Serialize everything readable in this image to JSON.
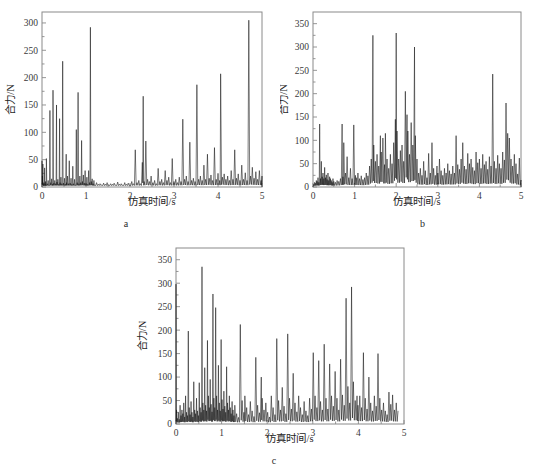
{
  "figure": {
    "panels": [
      {
        "id": "a",
        "sublabel": "a",
        "xlabel": "仿真时间/s",
        "ylabel": "合力/N"
      },
      {
        "id": "b",
        "sublabel": "b",
        "xlabel": "仿真时间/s",
        "ylabel": "合力/N"
      },
      {
        "id": "c",
        "sublabel": "c",
        "xlabel": "仿真时间/s",
        "ylabel": "合力/N"
      }
    ]
  },
  "chart_data": [
    {
      "type": "line",
      "panel": "a",
      "title": "",
      "subtitle": "a",
      "xlabel": "仿真时间/s",
      "ylabel": "合力/N",
      "xlim": [
        0,
        5
      ],
      "ylim": [
        0,
        320
      ],
      "xticks": [
        0,
        1,
        2,
        3,
        4,
        5
      ],
      "xticklabels": [
        "0",
        "1",
        "2",
        "3",
        "4",
        "5"
      ],
      "yticks": [
        0,
        50,
        100,
        150,
        200,
        250,
        300
      ],
      "yticklabels": [
        "0",
        "50",
        "100",
        "150",
        "200",
        "250",
        "300"
      ],
      "grid": false,
      "legend": null,
      "series": [
        {
          "name": "合力",
          "color": "#111111",
          "x": [
            0.0,
            0.01,
            0.02,
            0.03,
            0.04,
            0.05,
            0.06,
            0.07,
            0.08,
            0.09,
            0.1,
            0.12,
            0.14,
            0.16,
            0.18,
            0.2,
            0.22,
            0.24,
            0.25,
            0.27,
            0.29,
            0.31,
            0.33,
            0.34,
            0.36,
            0.38,
            0.4,
            0.41,
            0.43,
            0.45,
            0.47,
            0.49,
            0.51,
            0.53,
            0.55,
            0.56,
            0.58,
            0.6,
            0.62,
            0.64,
            0.66,
            0.68,
            0.7,
            0.72,
            0.74,
            0.76,
            0.78,
            0.8,
            0.82,
            0.84,
            0.86,
            0.88,
            0.9,
            0.92,
            0.94,
            0.96,
            0.98,
            1.0,
            1.02,
            1.04,
            1.06,
            1.08,
            1.1,
            1.12,
            1.14,
            1.16,
            1.18,
            1.2,
            1.24,
            1.28,
            1.32,
            1.36,
            1.4,
            1.44,
            1.48,
            1.52,
            1.56,
            1.6,
            1.64,
            1.68,
            1.72,
            1.76,
            1.8,
            1.84,
            1.88,
            1.92,
            1.96,
            2.0,
            2.04,
            2.08,
            2.12,
            2.16,
            2.2,
            2.24,
            2.28,
            2.3,
            2.32,
            2.36,
            2.4,
            2.44,
            2.48,
            2.52,
            2.56,
            2.6,
            2.64,
            2.68,
            2.72,
            2.76,
            2.8,
            2.84,
            2.88,
            2.92,
            2.96,
            3.0,
            3.04,
            3.08,
            3.12,
            3.16,
            3.2,
            3.24,
            3.28,
            3.32,
            3.36,
            3.4,
            3.44,
            3.48,
            3.52,
            3.56,
            3.6,
            3.64,
            3.68,
            3.72,
            3.76,
            3.8,
            3.84,
            3.88,
            3.92,
            3.96,
            4.0,
            4.04,
            4.06,
            4.1,
            4.14,
            4.18,
            4.22,
            4.26,
            4.3,
            4.34,
            4.38,
            4.42,
            4.46,
            4.5,
            4.54,
            4.58,
            4.62,
            4.66,
            4.7,
            4.74,
            4.78,
            4.82,
            4.86,
            4.9,
            4.94,
            4.98,
            5.0
          ],
          "y": [
            48,
            20,
            42,
            5,
            8,
            3,
            35,
            6,
            10,
            4,
            52,
            6,
            12,
            4,
            140,
            8,
            15,
            5,
            177,
            7,
            12,
            6,
            150,
            9,
            14,
            5,
            125,
            8,
            18,
            6,
            230,
            7,
            16,
            5,
            60,
            8,
            20,
            6,
            48,
            7,
            16,
            5,
            38,
            6,
            14,
            4,
            105,
            8,
            173,
            6,
            20,
            8,
            85,
            10,
            22,
            7,
            30,
            6,
            18,
            5,
            30,
            8,
            292,
            10,
            15,
            6,
            12,
            4,
            8,
            5,
            6,
            4,
            7,
            5,
            8,
            4,
            6,
            5,
            7,
            4,
            9,
            5,
            6,
            4,
            8,
            5,
            7,
            4,
            10,
            6,
            68,
            8,
            12,
            6,
            45,
            166,
            10,
            84,
            14,
            10,
            20,
            8,
            12,
            6,
            34,
            10,
            14,
            8,
            30,
            12,
            18,
            8,
            52,
            10,
            14,
            8,
            18,
            10,
            124,
            14,
            20,
            10,
            82,
            12,
            16,
            10,
            187,
            14,
            20,
            12,
            40,
            14,
            60,
            16,
            22,
            12,
            72,
            14,
            25,
            12,
            207,
            18,
            24,
            14,
            20,
            12,
            30,
            14,
            68,
            16,
            24,
            12,
            40,
            14,
            26,
            12,
            305,
            20,
            36,
            16,
            28,
            14,
            30,
            12,
            20,
            8
          ]
        }
      ]
    },
    {
      "type": "line",
      "panel": "b",
      "title": "",
      "subtitle": "b",
      "xlabel": "仿真时间/s",
      "ylabel": "合力/N",
      "xlim": [
        0,
        5
      ],
      "ylim": [
        0,
        375
      ],
      "xticks": [
        0,
        1,
        2,
        3,
        4,
        5
      ],
      "xticklabels": [
        "0",
        "1",
        "2",
        "3",
        "4",
        "5"
      ],
      "yticks": [
        0,
        50,
        100,
        150,
        200,
        250,
        300,
        350
      ],
      "yticklabels": [
        "0",
        "50",
        "100",
        "150",
        "200",
        "250",
        "300",
        "350"
      ],
      "grid": false,
      "legend": null,
      "series": [
        {
          "name": "合力",
          "color": "#111111",
          "x": [
            0.0,
            0.02,
            0.04,
            0.06,
            0.08,
            0.1,
            0.12,
            0.14,
            0.16,
            0.18,
            0.2,
            0.22,
            0.24,
            0.26,
            0.28,
            0.3,
            0.32,
            0.34,
            0.36,
            0.38,
            0.4,
            0.42,
            0.44,
            0.46,
            0.48,
            0.5,
            0.54,
            0.58,
            0.62,
            0.66,
            0.7,
            0.72,
            0.74,
            0.78,
            0.82,
            0.86,
            0.9,
            0.94,
            0.98,
            1.02,
            1.04,
            1.08,
            1.12,
            1.16,
            1.2,
            1.24,
            1.28,
            1.32,
            1.36,
            1.4,
            1.44,
            1.46,
            1.5,
            1.54,
            1.58,
            1.62,
            1.64,
            1.68,
            1.72,
            1.74,
            1.78,
            1.82,
            1.86,
            1.9,
            1.94,
            1.98,
            2.0,
            2.02,
            2.06,
            2.1,
            2.14,
            2.18,
            2.22,
            2.26,
            2.28,
            2.32,
            2.36,
            2.4,
            2.44,
            2.46,
            2.5,
            2.54,
            2.58,
            2.62,
            2.66,
            2.7,
            2.74,
            2.78,
            2.82,
            2.86,
            2.9,
            2.94,
            2.98,
            3.0,
            3.04,
            3.08,
            3.12,
            3.16,
            3.2,
            3.24,
            3.28,
            3.32,
            3.36,
            3.4,
            3.44,
            3.48,
            3.52,
            3.56,
            3.6,
            3.64,
            3.68,
            3.72,
            3.76,
            3.8,
            3.84,
            3.88,
            3.92,
            3.96,
            4.0,
            4.04,
            4.08,
            4.12,
            4.16,
            4.2,
            4.24,
            4.28,
            4.32,
            4.36,
            4.4,
            4.44,
            4.48,
            4.52,
            4.56,
            4.6,
            4.64,
            4.68,
            4.72,
            4.76,
            4.8,
            4.84,
            4.88,
            4.92,
            4.96,
            5.0
          ],
          "y": [
            2,
            6,
            10,
            8,
            14,
            12,
            20,
            10,
            135,
            18,
            55,
            22,
            30,
            18,
            42,
            20,
            26,
            16,
            30,
            14,
            22,
            18,
            14,
            10,
            18,
            12,
            10,
            14,
            12,
            18,
            135,
            22,
            95,
            30,
            65,
            20,
            40,
            18,
            133,
            25,
            20,
            30,
            18,
            24,
            16,
            20,
            30,
            24,
            45,
            60,
            325,
            90,
            55,
            70,
            45,
            110,
            75,
            105,
            48,
            115,
            60,
            40,
            70,
            50,
            95,
            145,
            330,
            120,
            60,
            78,
            90,
            55,
            205,
            155,
            120,
            70,
            138,
            90,
            300,
            110,
            60,
            30,
            40,
            25,
            55,
            35,
            20,
            72,
            30,
            95,
            40,
            25,
            45,
            30,
            60,
            35,
            25,
            40,
            30,
            50,
            35,
            28,
            45,
            30,
            110,
            48,
            38,
            60,
            95,
            45,
            38,
            72,
            50,
            60,
            42,
            35,
            75,
            52,
            60,
            40,
            70,
            48,
            55,
            38,
            65,
            45,
            242,
            55,
            40,
            68,
            50,
            40,
            75,
            58,
            180,
            115,
            105,
            60,
            45,
            70,
            50,
            28,
            62,
            15
          ]
        }
      ]
    },
    {
      "type": "line",
      "panel": "c",
      "title": "",
      "subtitle": "c",
      "xlabel": "仿真时间/s",
      "ylabel": "合力/N",
      "xlim": [
        0,
        5
      ],
      "ylim": [
        0,
        375
      ],
      "xticks": [
        0,
        1,
        2,
        3,
        4,
        5
      ],
      "xticklabels": [
        "0",
        "1",
        "2",
        "3",
        "4",
        "5"
      ],
      "yticks": [
        0,
        50,
        100,
        150,
        200,
        250,
        300,
        350
      ],
      "yticklabels": [
        "0",
        "50",
        "100",
        "150",
        "200",
        "250",
        "300",
        "350"
      ],
      "grid": false,
      "legend": null,
      "series": [
        {
          "name": "合力",
          "color": "#111111",
          "x": [
            0.0,
            0.01,
            0.03,
            0.05,
            0.07,
            0.09,
            0.11,
            0.13,
            0.15,
            0.17,
            0.19,
            0.21,
            0.23,
            0.25,
            0.27,
            0.29,
            0.31,
            0.33,
            0.35,
            0.37,
            0.39,
            0.41,
            0.43,
            0.45,
            0.47,
            0.49,
            0.51,
            0.53,
            0.55,
            0.57,
            0.59,
            0.61,
            0.63,
            0.65,
            0.67,
            0.69,
            0.71,
            0.73,
            0.75,
            0.77,
            0.79,
            0.81,
            0.83,
            0.85,
            0.87,
            0.89,
            0.91,
            0.93,
            0.95,
            0.97,
            0.99,
            1.01,
            1.03,
            1.05,
            1.07,
            1.09,
            1.11,
            1.13,
            1.15,
            1.17,
            1.19,
            1.21,
            1.23,
            1.25,
            1.27,
            1.29,
            1.33,
            1.37,
            1.41,
            1.45,
            1.49,
            1.51,
            1.55,
            1.59,
            1.63,
            1.67,
            1.71,
            1.75,
            1.79,
            1.83,
            1.87,
            1.89,
            1.93,
            1.97,
            2.01,
            2.05,
            2.09,
            2.13,
            2.17,
            2.21,
            2.25,
            2.29,
            2.33,
            2.37,
            2.41,
            2.45,
            2.49,
            2.53,
            2.57,
            2.61,
            2.65,
            2.69,
            2.73,
            2.77,
            2.81,
            2.85,
            2.89,
            2.93,
            2.97,
            3.01,
            3.05,
            3.09,
            3.13,
            3.17,
            3.21,
            3.25,
            3.29,
            3.33,
            3.37,
            3.41,
            3.45,
            3.49,
            3.53,
            3.57,
            3.61,
            3.65,
            3.69,
            3.73,
            3.77,
            3.81,
            3.85,
            3.89,
            3.93,
            3.97,
            3.99,
            4.03,
            4.07,
            4.11,
            4.15,
            4.19,
            4.23,
            4.27,
            4.31,
            4.35,
            4.39,
            4.43,
            4.47,
            4.51,
            4.55,
            4.59,
            4.63,
            4.67,
            4.71,
            4.75,
            4.79,
            4.83,
            4.87,
            4.91,
            4.95,
            5.0
          ],
          "y": [
            298,
            30,
            12,
            25,
            10,
            40,
            18,
            30,
            22,
            45,
            15,
            60,
            25,
            18,
            198,
            35,
            20,
            48,
            25,
            15,
            90,
            30,
            22,
            55,
            28,
            18,
            88,
            35,
            25,
            335,
            45,
            30,
            120,
            40,
            28,
            178,
            60,
            35,
            95,
            42,
            26,
            277,
            55,
            35,
            248,
            60,
            30,
            125,
            45,
            28,
            180,
            52,
            32,
            70,
            38,
            25,
            122,
            45,
            30,
            60,
            35,
            22,
            48,
            30,
            18,
            40,
            22,
            14,
            212,
            50,
            25,
            60,
            35,
            20,
            48,
            28,
            16,
            142,
            40,
            24,
            100,
            55,
            30,
            45,
            25,
            15,
            60,
            35,
            20,
            182,
            50,
            30,
            78,
            38,
            22,
            192,
            55,
            32,
            108,
            45,
            26,
            60,
            35,
            20,
            48,
            28,
            18,
            55,
            32,
            152,
            60,
            35,
            135,
            48,
            30,
            170,
            55,
            32,
            128,
            60,
            38,
            112,
            55,
            30,
            138,
            62,
            40,
            268,
            80,
            45,
            292,
            90,
            50,
            60,
            40,
            60,
            35,
            152,
            55,
            32,
            100,
            45,
            28,
            60,
            38,
            150,
            55,
            30,
            45,
            28,
            20,
            68,
            42,
            62,
            30,
            45,
            28
          ]
        }
      ]
    }
  ]
}
